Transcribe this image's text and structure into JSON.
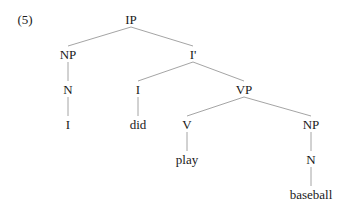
{
  "example_number": "(5)",
  "tree": {
    "nodes": [
      {
        "id": "ip",
        "label": "IP",
        "x": 131,
        "y": 19
      },
      {
        "id": "np1",
        "label": "NP",
        "x": 68,
        "y": 54
      },
      {
        "id": "ibar",
        "label": "I'",
        "x": 193,
        "y": 54
      },
      {
        "id": "n1",
        "label": "N",
        "x": 68,
        "y": 89
      },
      {
        "id": "i",
        "label": "I",
        "x": 138,
        "y": 89
      },
      {
        "id": "vp",
        "label": "VP",
        "x": 244,
        "y": 89
      },
      {
        "id": "w_i",
        "label": "I",
        "x": 68,
        "y": 124
      },
      {
        "id": "w_did",
        "label": "did",
        "x": 138,
        "y": 124
      },
      {
        "id": "v",
        "label": "V",
        "x": 187,
        "y": 124
      },
      {
        "id": "np2",
        "label": "NP",
        "x": 311,
        "y": 124
      },
      {
        "id": "w_play",
        "label": "play",
        "x": 187,
        "y": 159
      },
      {
        "id": "n2",
        "label": "N",
        "x": 311,
        "y": 159
      },
      {
        "id": "w_baseball",
        "label": "baseball",
        "x": 311,
        "y": 194
      }
    ],
    "edges": [
      [
        "ip",
        "np1"
      ],
      [
        "ip",
        "ibar"
      ],
      [
        "np1",
        "n1"
      ],
      [
        "n1",
        "w_i"
      ],
      [
        "ibar",
        "i"
      ],
      [
        "ibar",
        "vp"
      ],
      [
        "i",
        "w_did"
      ],
      [
        "vp",
        "v"
      ],
      [
        "vp",
        "np2"
      ],
      [
        "v",
        "w_play"
      ],
      [
        "np2",
        "n2"
      ],
      [
        "n2",
        "w_baseball"
      ]
    ]
  },
  "labels": {
    "ip": "IP",
    "np1": "NP",
    "ibar": "I'",
    "n1": "N",
    "i": "I",
    "vp": "VP",
    "w_i": "I",
    "w_did": "did",
    "v": "V",
    "np2": "NP",
    "w_play": "play",
    "n2": "N",
    "w_baseball": "baseball"
  },
  "colors": {
    "line": "#9a9a9a",
    "text": "#1a1a1a"
  }
}
